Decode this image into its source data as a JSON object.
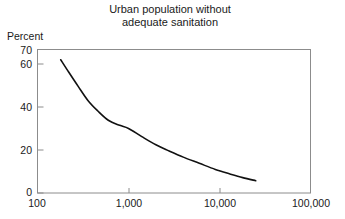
{
  "chart_data": {
    "type": "line",
    "title": "Urban population without adequate sanitation",
    "title_lines": [
      "Urban population without",
      "adequate sanitation"
    ],
    "ylabel": "Percent",
    "xlabel": "",
    "xscale": "log",
    "yscale": "linear",
    "xlim": [
      100,
      100000
    ],
    "ylim": [
      0,
      70
    ],
    "grid": false,
    "legend": null,
    "xticks": [
      100,
      1000,
      10000,
      100000
    ],
    "xtick_labels": [
      "100",
      "1,000",
      "10,000",
      "100,000"
    ],
    "yticks": [
      0,
      20,
      40,
      60,
      70
    ],
    "ytick_labels": [
      "0",
      "20",
      "40",
      "60",
      "70"
    ],
    "series": [
      {
        "name": "Urban population without adequate sanitation",
        "color": "#111111",
        "x": [
          180,
          220,
          280,
          360,
          460,
          600,
          800,
          1000,
          1400,
          2000,
          2800,
          4000,
          6000,
          9000,
          13000,
          18000,
          25000
        ],
        "y": [
          65.0,
          59.0,
          52.0,
          45.0,
          40.0,
          35.5,
          33.0,
          31.5,
          27.5,
          23.5,
          20.5,
          17.5,
          14.5,
          11.5,
          9.3,
          7.5,
          6.0
        ]
      }
    ]
  },
  "colors": {
    "curve": "#111111",
    "axis": "#8c8c8c",
    "text": "#1a1a1a",
    "background": "#ffffff"
  }
}
